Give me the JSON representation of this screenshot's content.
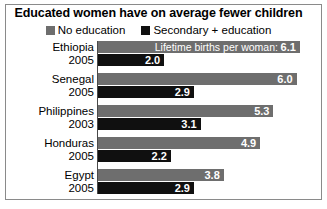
{
  "title": "Educated women have on average fewer children",
  "legend": {
    "items": [
      {
        "label": "No education",
        "color": "#6e6e6e",
        "swatch": "gray-square-icon"
      },
      {
        "label": "Secondary + education",
        "color": "#101010",
        "swatch": "black-square-icon"
      }
    ]
  },
  "annotation": {
    "text": "Lifetime births per woman:",
    "attached_to": "Ethiopia"
  },
  "rows": [
    {
      "country": "Ethiopia",
      "year": "2005",
      "no_education": "6.1",
      "secondary_education": "2.0",
      "annotation": "Lifetime births per woman: 6.1"
    },
    {
      "country": "Senegal",
      "year": "2005",
      "no_education": "6.0",
      "secondary_education": "2.9"
    },
    {
      "country": "Philippines",
      "year": "2003",
      "no_education": "5.3",
      "secondary_education": "3.1"
    },
    {
      "country": "Honduras",
      "year": "2005",
      "no_education": "4.9",
      "secondary_education": "2.2"
    },
    {
      "country": "Egypt",
      "year": "2005",
      "no_education": "3.8",
      "secondary_education": "2.9"
    }
  ],
  "chart_data": {
    "type": "bar",
    "orientation": "horizontal",
    "title": "Educated women have on average fewer children",
    "subtitle": "",
    "xlabel": "Lifetime births per woman",
    "ylabel": "",
    "categories": [
      "Ethiopia 2005",
      "Senegal 2005",
      "Philippines 2003",
      "Honduras 2005",
      "Egypt 2005"
    ],
    "series": [
      {
        "name": "No education",
        "color": "#6e6e6e",
        "values": [
          6.1,
          6.0,
          5.3,
          4.9,
          3.8
        ]
      },
      {
        "name": "Secondary + education",
        "color": "#101010",
        "values": [
          2.0,
          2.9,
          3.1,
          2.2,
          2.9
        ]
      }
    ],
    "xlim": [
      0,
      6.2
    ],
    "grid": false,
    "legend_position": "top-center",
    "data_labels": true,
    "annotations": [
      {
        "text": "Lifetime births per woman: 6.1",
        "series": "No education",
        "category": "Ethiopia 2005"
      }
    ]
  }
}
